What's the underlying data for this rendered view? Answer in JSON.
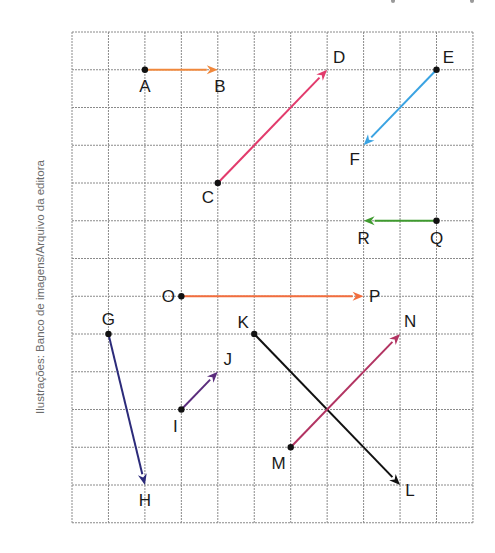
{
  "caption": "Ilustrações: Banco de imagens/Arquivo da editora",
  "grid": {
    "left": 72,
    "top": 32,
    "cols": 11,
    "rows": 13,
    "col_width": 36.45,
    "row_height": 37.75,
    "line_color": "#8a8a8a",
    "line_style": "dashed"
  },
  "points": [
    {
      "name": "A",
      "col": 2,
      "row": 1,
      "label_dx": 0,
      "label_dy": 16
    },
    {
      "name": "B",
      "col": 4,
      "row": 1,
      "label_dx": 2,
      "label_dy": 16
    },
    {
      "name": "C",
      "col": 4,
      "row": 4,
      "label_dx": -10,
      "label_dy": 14
    },
    {
      "name": "D",
      "col": 7,
      "row": 1,
      "label_dx": 12,
      "label_dy": -13
    },
    {
      "name": "E",
      "col": 10,
      "row": 1,
      "label_dx": 12,
      "label_dy": -13
    },
    {
      "name": "F",
      "col": 8,
      "row": 3,
      "label_dx": -9,
      "label_dy": 14
    },
    {
      "name": "Q",
      "col": 10,
      "row": 5,
      "label_dx": 0,
      "label_dy": 17
    },
    {
      "name": "R",
      "col": 8,
      "row": 5,
      "label_dx": 0,
      "label_dy": 17
    },
    {
      "name": "O",
      "col": 3,
      "row": 7,
      "label_dx": -13,
      "label_dy": 0
    },
    {
      "name": "P",
      "col": 8,
      "row": 7,
      "label_dx": 11,
      "label_dy": 0
    },
    {
      "name": "G",
      "col": 1,
      "row": 8,
      "label_dx": 0,
      "label_dy": -15
    },
    {
      "name": "H",
      "col": 2,
      "row": 12,
      "label_dx": 0,
      "label_dy": 15
    },
    {
      "name": "I",
      "col": 3,
      "row": 10,
      "label_dx": -6,
      "label_dy": 16
    },
    {
      "name": "J",
      "col": 4,
      "row": 9,
      "label_dx": 10,
      "label_dy": -13
    },
    {
      "name": "K",
      "col": 5,
      "row": 8,
      "label_dx": -11,
      "label_dy": -12
    },
    {
      "name": "L",
      "col": 9,
      "row": 12,
      "label_dx": 10,
      "label_dy": 5
    },
    {
      "name": "M",
      "col": 6,
      "row": 11,
      "label_dx": -12,
      "label_dy": 16
    },
    {
      "name": "N",
      "col": 9,
      "row": 8,
      "label_dx": 10,
      "label_dy": -13
    }
  ],
  "vectors": [
    {
      "id": "AB",
      "from": "A",
      "to": "B",
      "color": "#f0883c"
    },
    {
      "id": "CD",
      "from": "C",
      "to": "D",
      "color": "#e23b6c"
    },
    {
      "id": "EF",
      "from": "E",
      "to": "F",
      "color": "#3aa3e2"
    },
    {
      "id": "QR",
      "from": "Q",
      "to": "R",
      "color": "#3f9a2f"
    },
    {
      "id": "OP",
      "from": "O",
      "to": "P",
      "color": "#f26d3d"
    },
    {
      "id": "GH",
      "from": "G",
      "to": "H",
      "color": "#2c2b7a"
    },
    {
      "id": "IJ",
      "from": "I",
      "to": "J",
      "color": "#5b2d7d"
    },
    {
      "id": "KL",
      "from": "K",
      "to": "L",
      "color": "#111111"
    },
    {
      "id": "MN",
      "from": "M",
      "to": "N",
      "color": "#b23462"
    }
  ]
}
